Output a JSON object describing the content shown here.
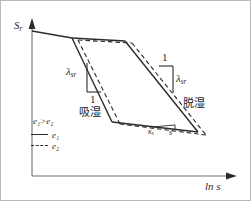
{
  "figure": {
    "type": "line-diagram"
  },
  "axes": {
    "y_label": "S",
    "y_label_sub": "r",
    "x_label": "ln s",
    "arrow_y_icon": "arrow-up-icon",
    "arrow_x_icon": "arrow-right-icon"
  },
  "annotations": {
    "left_slope_symbol": "λ",
    "left_slope_symbol_sub": "sr",
    "left_slope_unit": "1",
    "left_branch_label": "吸湿",
    "right_slope_unit": "1",
    "right_slope_symbol": "λ",
    "right_slope_symbol_sub": "sr",
    "right_branch_label": "脱湿",
    "bottom_kappa": "κ",
    "bottom_kappa_sub": "s",
    "bottom_s": "s"
  },
  "legend": {
    "title": "e₁>e₂",
    "items": [
      {
        "style": "solid",
        "label": "e₁"
      },
      {
        "style": "dashed",
        "label": "e₂"
      }
    ]
  },
  "colors": {
    "line": "#2b2b2b",
    "axis": "#6f6f6f",
    "border": "#b9b9b9",
    "background": "#ffffff"
  },
  "chart_data": {
    "type": "line",
    "title": "",
    "xlabel": "ln s",
    "ylabel": "S_r",
    "grid": false,
    "legend_position": "lower-left",
    "series": [
      {
        "name": "e1",
        "style": "solid",
        "points": [
          [
            32,
            31
          ],
          [
            72,
            38
          ],
          [
            125,
            41
          ],
          [
            198,
            132
          ],
          [
            112,
            122
          ],
          [
            72,
            38
          ]
        ]
      },
      {
        "name": "e2",
        "style": "dashed",
        "points": [
          [
            78,
            40
          ],
          [
            132,
            43
          ],
          [
            206,
            135
          ],
          [
            120,
            124
          ],
          [
            78,
            40
          ]
        ]
      }
    ]
  }
}
